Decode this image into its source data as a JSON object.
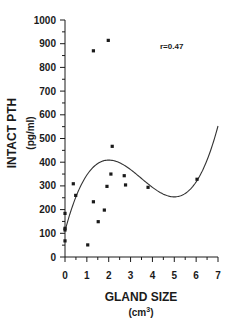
{
  "chart_data": {
    "type": "scatter",
    "title": "",
    "xlabel": "GLAND SIZE",
    "xlabel_unit": "(cm",
    "xlabel_unit_sup": "3",
    "xlabel_unit_close": ")",
    "ylabel": "INTACT PTH",
    "ylabel_unit": "(pg/ml)",
    "xlim": [
      0,
      7
    ],
    "ylim": [
      0,
      1000
    ],
    "xticks": [
      0,
      1,
      2,
      3,
      4,
      5,
      6,
      7
    ],
    "yticks": [
      0,
      100,
      200,
      300,
      400,
      500,
      600,
      700,
      800,
      900,
      1000
    ],
    "grid": false,
    "legend": null,
    "annotation": {
      "text": "r=0.47",
      "x": 4.5,
      "y": 930
    },
    "points": [
      {
        "x": 0.0,
        "y": 184
      },
      {
        "x": 0.0,
        "y": 121
      },
      {
        "x": 0.0,
        "y": 114
      },
      {
        "x": 0.0,
        "y": 68
      },
      {
        "x": 0.38,
        "y": 309
      },
      {
        "x": 0.49,
        "y": 260
      },
      {
        "x": 1.04,
        "y": 51
      },
      {
        "x": 1.3,
        "y": 870
      },
      {
        "x": 1.3,
        "y": 233
      },
      {
        "x": 1.52,
        "y": 149
      },
      {
        "x": 1.8,
        "y": 198
      },
      {
        "x": 1.92,
        "y": 298
      },
      {
        "x": 1.98,
        "y": 914
      },
      {
        "x": 2.1,
        "y": 350
      },
      {
        "x": 2.16,
        "y": 467
      },
      {
        "x": 2.71,
        "y": 343
      },
      {
        "x": 2.77,
        "y": 304
      },
      {
        "x": 3.8,
        "y": 294
      },
      {
        "x": 6.04,
        "y": 328
      }
    ],
    "fit_curve": {
      "type": "cubic",
      "coefficients": {
        "a": 110,
        "b": 345,
        "c": -120.75,
        "d": 11.5
      },
      "description": "y = a + b*x + c*x^2 + d*x^3",
      "x_range": [
        0,
        7
      ]
    }
  },
  "style": {
    "ink": "#1a1a1a",
    "curve": "#333333",
    "background": "#ffffff"
  }
}
